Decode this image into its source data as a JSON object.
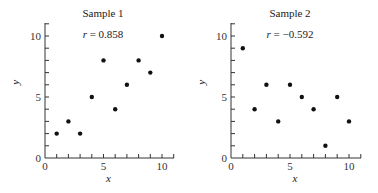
{
  "chart_data": [
    {
      "type": "scatter",
      "title": "Sample 1",
      "subtitle": "r = 0.858",
      "r_symbol": "r",
      "r_value": "= 0.858",
      "xlabel": "x",
      "ylabel": "y",
      "xlim": [
        0,
        11
      ],
      "ylim": [
        0,
        11
      ],
      "xticks": [
        0,
        5,
        10
      ],
      "yticks": [
        0,
        5,
        10
      ],
      "grid": false,
      "x": [
        1,
        2,
        3,
        4,
        5,
        6,
        7,
        8,
        9,
        10
      ],
      "y": [
        2,
        3,
        2,
        5,
        8,
        4,
        6,
        8,
        7,
        10
      ]
    },
    {
      "type": "scatter",
      "title": "Sample 2",
      "subtitle": "r = −0.592",
      "r_symbol": "r",
      "r_value": "= −0.592",
      "xlabel": "x",
      "ylabel": "y",
      "xlim": [
        0,
        11
      ],
      "ylim": [
        0,
        11
      ],
      "xticks": [
        0,
        5,
        10
      ],
      "yticks": [
        0,
        5,
        10
      ],
      "grid": false,
      "x": [
        1,
        2,
        3,
        4,
        5,
        6,
        7,
        8,
        9,
        10
      ],
      "y": [
        9,
        4,
        6,
        3,
        6,
        5,
        4,
        1,
        5,
        3
      ]
    }
  ]
}
